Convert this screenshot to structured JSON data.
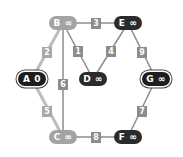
{
  "graph": {
    "title": "Dijkstra shortest-path graph",
    "colors": {
      "visited": "#a3a3a3",
      "unvisited": "#2b2b2b",
      "source": "#1e1e1e",
      "edge": "#8c8c8c",
      "edge_light": "#bdbdbd"
    },
    "nodes": [
      {
        "id": "A",
        "label": "A 0",
        "x": 32,
        "y": 79,
        "style": "ring"
      },
      {
        "id": "B",
        "label": "B ∞",
        "x": 63,
        "y": 23,
        "style": "light"
      },
      {
        "id": "C",
        "label": "C ∞",
        "x": 63,
        "y": 137,
        "style": "light"
      },
      {
        "id": "D",
        "label": "D ∞",
        "x": 93,
        "y": 79,
        "style": "dark"
      },
      {
        "id": "E",
        "label": "E ∞",
        "x": 128,
        "y": 23,
        "style": "dark"
      },
      {
        "id": "F",
        "label": "F ∞",
        "x": 128,
        "y": 137,
        "style": "dark"
      },
      {
        "id": "G",
        "label": "G ∞",
        "x": 156,
        "y": 79,
        "style": "ring"
      }
    ],
    "edges": [
      {
        "from": "B",
        "to": "E",
        "weight": "3",
        "lx": 96,
        "ly": 23
      },
      {
        "from": "A",
        "to": "B",
        "weight": "2",
        "lx": 47,
        "ly": 52,
        "light": true
      },
      {
        "from": "B",
        "to": "D",
        "weight": "1",
        "lx": 78,
        "ly": 51
      },
      {
        "from": "B",
        "to": "C",
        "weight": "6",
        "lx": 63,
        "ly": 84
      },
      {
        "from": "E",
        "to": "D",
        "weight": "4",
        "lx": 111,
        "ly": 51
      },
      {
        "from": "E",
        "to": "G",
        "weight": "9",
        "lx": 142,
        "ly": 52
      },
      {
        "from": "A",
        "to": "C",
        "weight": "5",
        "lx": 47,
        "ly": 111,
        "light": true
      },
      {
        "from": "C",
        "to": "F",
        "weight": "8",
        "lx": 96,
        "ly": 137
      },
      {
        "from": "G",
        "to": "F",
        "weight": "7",
        "lx": 142,
        "ly": 111
      }
    ]
  }
}
